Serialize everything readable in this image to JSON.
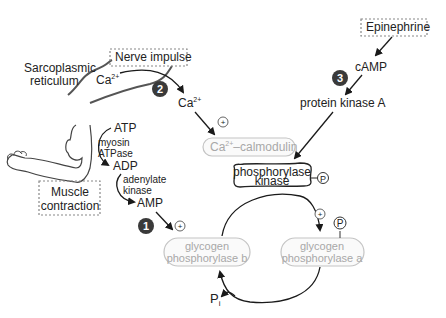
{
  "diagram": {
    "colors": {
      "text": "#222222",
      "inactive_text": "#a8a8a8",
      "inactive_border": "#c4c4c4",
      "step_badge": "#3a3a3a",
      "dashed_border": "#888888"
    },
    "labels": {
      "sarcoplasmic_1": "Sarcoplasmic",
      "sarcoplasmic_2": "reticulum",
      "nerve_impulse": "Nerve impulse",
      "ca_sr": "Ca",
      "ca_sr_sup": "2+",
      "ca_released": "Ca",
      "ca_released_sup": "2+",
      "ca_calmodulin_a": "Ca",
      "ca_calmodulin_sup": "2+",
      "ca_calmodulin_b": "–calmodulin",
      "epinephrine": "Epinephrine",
      "camp": "cAMP",
      "pka": "protein kinase A",
      "phk_1": "phosphorylase",
      "phk_2": "kinase",
      "atp": "ATP",
      "myosin_1": "myosin",
      "myosin_2": "ATPase",
      "adp": "ADP",
      "adenylate_1": "adenylate",
      "adenylate_2": "kinase",
      "amp": "AMP",
      "muscle_1": "Muscle",
      "muscle_2": "contraction",
      "gpb_1": "glycogen",
      "gpb_2": "phosphorylase b",
      "gpa_1": "glycogen",
      "gpa_2": "phosphorylase a",
      "pi": "P",
      "pi_sub": "i",
      "phosphate": "P",
      "plus": "+"
    },
    "steps": [
      {
        "number": "1",
        "label": "AMP activation"
      },
      {
        "number": "2",
        "label": "Ca2+ release"
      },
      {
        "number": "3",
        "label": "Epinephrine / cAMP"
      }
    ]
  }
}
